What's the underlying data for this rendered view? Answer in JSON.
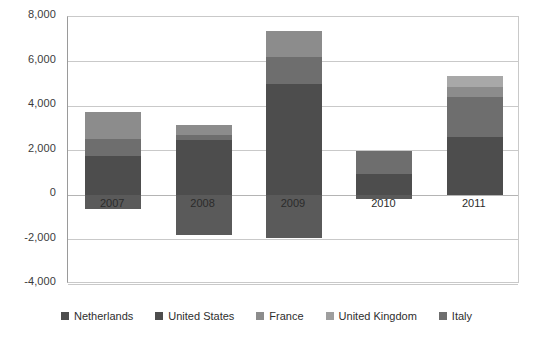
{
  "chart_data": {
    "type": "bar",
    "subtype": "stacked-bar-with-negatives",
    "title": "",
    "xlabel": "",
    "ylabel": "",
    "categories": [
      "2007",
      "2008",
      "2009",
      "2010",
      "2011"
    ],
    "ylim": [
      -4000,
      8000
    ],
    "yticks": [
      -4000,
      -2000,
      0,
      2000,
      4000,
      6000,
      8000
    ],
    "ytick_labels": [
      "-4,000",
      "-2,000",
      "0",
      "2,000",
      "4,000",
      "6,000",
      "8,000"
    ],
    "grid": true,
    "legend_position": "bottom",
    "series": [
      {
        "name": "Netherlands",
        "color": "#4d4d4d",
        "values": [
          1750,
          2450,
          5000,
          950,
          2600
        ]
      },
      {
        "name": "United States",
        "color": "#6e6e6e",
        "values": [
          750,
          250,
          1200,
          1050,
          1800
        ]
      },
      {
        "name": "France",
        "color": "#8c8c8c",
        "values": [
          1250,
          450,
          1150,
          0,
          450
        ]
      },
      {
        "name": "United Kingdom",
        "color": "#a8a8a8",
        "values": [
          0,
          0,
          0,
          0,
          500
        ]
      },
      {
        "name": "Italy",
        "color": "#5a5a5a",
        "values": [
          -650,
          -1780,
          -1950,
          -170,
          0
        ]
      }
    ],
    "totals_positive": [
      3750,
      3150,
      7350,
      2000,
      5350
    ],
    "totals_negative": [
      -650,
      -1780,
      -1950,
      -170,
      0
    ]
  },
  "legend": {
    "items": [
      {
        "label": "Netherlands",
        "color": "#4d4d4d"
      },
      {
        "label": "United States",
        "color": "#4d4d4d"
      },
      {
        "label": "France",
        "color": "#8c8c8c"
      },
      {
        "label": "United Kingdom",
        "color": "#9e9e9e"
      },
      {
        "label": "Italy",
        "color": "#6e6e6e"
      }
    ]
  },
  "axis": {
    "y_labels": [
      "8,000",
      "6,000",
      "4,000",
      "2,000",
      "0",
      "-2,000",
      "-4,000"
    ]
  },
  "colors": {
    "background": "#ffffff",
    "gridline": "#c9c9c9",
    "axis_line": "#9a9a9a",
    "text": "#2e2e2e"
  }
}
